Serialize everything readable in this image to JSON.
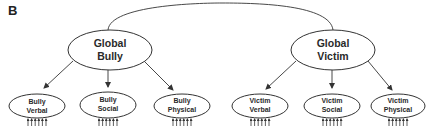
{
  "panel_label": "B",
  "colors": {
    "stroke": "#333333",
    "text": "#2a2a2a",
    "background": "#ffffff"
  },
  "correlation": {
    "from": "global_bully",
    "to": "global_victim",
    "type": "curved-bidirectional-link"
  },
  "global_factors": [
    {
      "id": "global_bully",
      "line1": "Global",
      "line2": "Bully",
      "cx": 110,
      "cy": 50
    },
    {
      "id": "global_victim",
      "line1": "Global",
      "line2": "Victim",
      "cx": 333,
      "cy": 50
    }
  ],
  "sub_factors": [
    {
      "id": "bully_verbal",
      "parent": "global_bully",
      "line1": "Bully",
      "line2": "Verbal",
      "cx": 37,
      "cy": 106,
      "indicator_count": 6
    },
    {
      "id": "bully_social",
      "parent": "global_bully",
      "line1": "Bully",
      "line2": "Social",
      "cx": 108,
      "cy": 105,
      "indicator_count": 6
    },
    {
      "id": "bully_physical",
      "parent": "global_bully",
      "line1": "Bully",
      "line2": "Physical",
      "cx": 182,
      "cy": 106,
      "indicator_count": 6
    },
    {
      "id": "victim_verbal",
      "parent": "global_victim",
      "line1": "Victim",
      "line2": "Verbal",
      "cx": 260,
      "cy": 106,
      "indicator_count": 6
    },
    {
      "id": "victim_social",
      "parent": "global_victim",
      "line1": "Victim",
      "line2": "Social",
      "cx": 332,
      "cy": 106,
      "indicator_count": 6
    },
    {
      "id": "victim_physical",
      "parent": "global_victim",
      "line1": "Victim",
      "line2": "Physical",
      "cx": 398,
      "cy": 106,
      "indicator_count": 6
    }
  ]
}
